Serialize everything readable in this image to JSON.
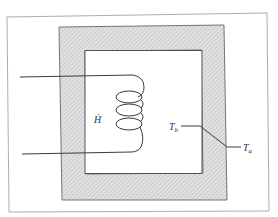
{
  "figure": {
    "heater_label": "Ḣ",
    "inner_temp_label": "T",
    "inner_temp_sub": "b",
    "outer_temp_label": "T",
    "outer_temp_sub": "a"
  },
  "colors": {
    "line": "#3a3a3a",
    "hatch_bg": "#d8d8d8",
    "frame": "#888888"
  }
}
